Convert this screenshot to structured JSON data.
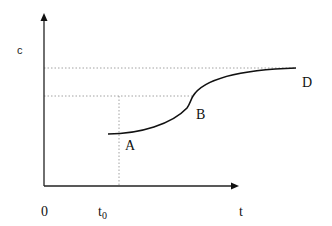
{
  "diagram": {
    "type": "concentration-time curve",
    "colors": {
      "axis": "#222222",
      "curve": "#111111",
      "guide": "#888888",
      "background": "#ffffff"
    },
    "axes": {
      "y_label": "c",
      "x_label": "t",
      "origin_label": "0",
      "x_tick_label": "t",
      "x_tick_subscript": "0"
    },
    "points": [
      {
        "label": "A",
        "description": "start of curve at t0"
      },
      {
        "label": "B",
        "description": "inflection point"
      },
      {
        "label": "D",
        "description": "plateau end"
      }
    ],
    "guides": [
      {
        "name": "upper-plateau-level",
        "style": "dotted"
      },
      {
        "name": "inflection-level",
        "style": "dotted"
      },
      {
        "name": "t0-vertical",
        "style": "dotted"
      }
    ]
  }
}
